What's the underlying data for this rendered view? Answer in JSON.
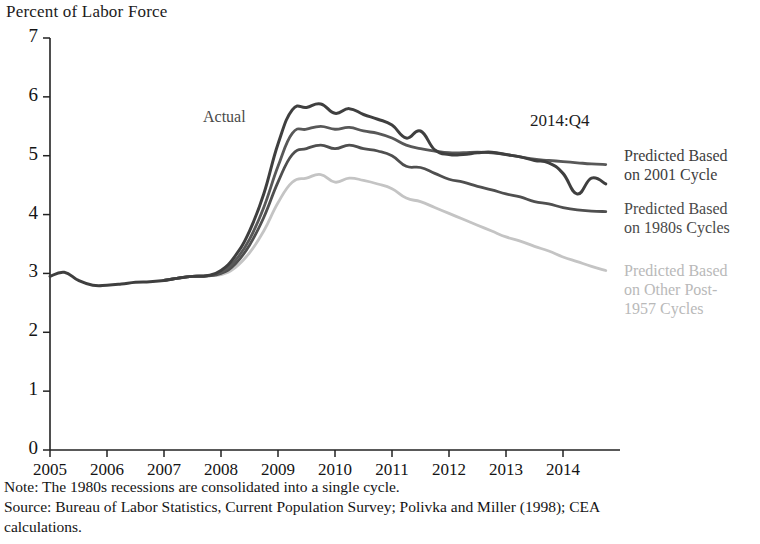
{
  "header": {
    "axis_title": "Percent of Labor Force"
  },
  "annotations": {
    "actual_label": "Actual",
    "date_marker": "2014:Q4"
  },
  "legend": [
    {
      "name": "predicted-2001-cycle",
      "line1": "Predicted Based",
      "line2": "on 2001 Cycle",
      "color": "#3d3d3d"
    },
    {
      "name": "predicted-1980s-cycles",
      "line1": "Predicted Based",
      "line2": "on 1980s Cycles",
      "color": "#4a4a4a"
    },
    {
      "name": "predicted-other-post-1957-cycles",
      "line1": "Predicted Based",
      "line2": "on Other Post-",
      "line3": "1957 Cycles",
      "color": "#b9b9b9"
    }
  ],
  "notes": {
    "note": "Note: The 1980s recessions are consolidated into a single cycle.",
    "source": "Source: Bureau of Labor Statistics, Current Population Survey; Polivka and Miller (1998); CEA",
    "source_cont": "calculations."
  },
  "chart_data": {
    "type": "line",
    "title": "Percent of Labor Force",
    "xlabel": "",
    "ylabel": "Percent of Labor Force",
    "xlim": [
      2005.0,
      2015.0
    ],
    "ylim": [
      0,
      7
    ],
    "yticks": [
      0,
      1,
      2,
      3,
      4,
      5,
      6,
      7
    ],
    "xticks": [
      2005,
      2006,
      2007,
      2008,
      2009,
      2010,
      2011,
      2012,
      2013,
      2014
    ],
    "xtick_labels": [
      "2005",
      "2006",
      "2007",
      "2008",
      "2009",
      "2010",
      "2011",
      "2012",
      "2013",
      "2014"
    ],
    "ytick_labels": [
      "0",
      "1",
      "2",
      "3",
      "4",
      "5",
      "6",
      "7"
    ],
    "grid": false,
    "legend_position": "right",
    "x": [
      2005.0,
      2005.25,
      2005.5,
      2005.75,
      2006.0,
      2006.25,
      2006.5,
      2006.75,
      2007.0,
      2007.25,
      2007.5,
      2007.75,
      2008.0,
      2008.25,
      2008.5,
      2008.75,
      2009.0,
      2009.25,
      2009.5,
      2009.75,
      2010.0,
      2010.25,
      2010.5,
      2010.75,
      2011.0,
      2011.25,
      2011.5,
      2011.75,
      2012.0,
      2012.25,
      2012.5,
      2012.75,
      2013.0,
      2013.25,
      2013.5,
      2013.75,
      2014.0,
      2014.25,
      2014.5,
      2014.75
    ],
    "series": [
      {
        "name": "Actual",
        "color": "#3f3f3f",
        "width": 3.0,
        "values": [
          2.95,
          3.02,
          2.88,
          2.8,
          2.8,
          2.82,
          2.85,
          2.86,
          2.88,
          2.92,
          2.95,
          2.96,
          3.05,
          3.3,
          3.72,
          4.35,
          5.2,
          5.78,
          5.82,
          5.88,
          5.72,
          5.8,
          5.7,
          5.62,
          5.52,
          5.3,
          5.42,
          5.1,
          5.02,
          5.02,
          5.05,
          5.06,
          5.02,
          4.98,
          4.92,
          4.88,
          4.7,
          4.35,
          4.62,
          4.52
        ]
      },
      {
        "name": "Predicted Based on 2001 Cycle",
        "color": "#585858",
        "width": 2.8,
        "values": [
          null,
          null,
          null,
          null,
          null,
          null,
          null,
          null,
          2.88,
          2.92,
          2.95,
          2.96,
          3.02,
          3.22,
          3.58,
          4.12,
          4.82,
          5.38,
          5.45,
          5.5,
          5.45,
          5.48,
          5.42,
          5.38,
          5.3,
          5.18,
          5.12,
          5.08,
          5.05,
          5.05,
          5.06,
          5.05,
          5.02,
          4.98,
          4.94,
          4.92,
          4.9,
          4.88,
          4.86,
          4.85
        ]
      },
      {
        "name": "Predicted Based on 1980s Cycles",
        "color": "#4f4f4f",
        "width": 2.8,
        "values": [
          null,
          null,
          null,
          null,
          null,
          null,
          null,
          null,
          2.88,
          2.92,
          2.95,
          2.96,
          3.0,
          3.16,
          3.48,
          3.95,
          4.55,
          5.02,
          5.12,
          5.18,
          5.12,
          5.18,
          5.12,
          5.08,
          5.0,
          4.82,
          4.8,
          4.7,
          4.6,
          4.55,
          4.48,
          4.42,
          4.35,
          4.3,
          4.22,
          4.18,
          4.12,
          4.08,
          4.06,
          4.05
        ]
      },
      {
        "name": "Predicted Based on Other Post-1957 Cycles",
        "color": "#c4c4c4",
        "width": 2.8,
        "values": [
          null,
          null,
          null,
          null,
          null,
          null,
          null,
          null,
          2.88,
          2.92,
          2.95,
          2.96,
          2.98,
          3.1,
          3.35,
          3.72,
          4.2,
          4.55,
          4.62,
          4.68,
          4.55,
          4.62,
          4.58,
          4.52,
          4.44,
          4.28,
          4.22,
          4.12,
          4.02,
          3.92,
          3.82,
          3.72,
          3.62,
          3.55,
          3.46,
          3.38,
          3.28,
          3.2,
          3.12,
          3.05
        ]
      }
    ]
  }
}
